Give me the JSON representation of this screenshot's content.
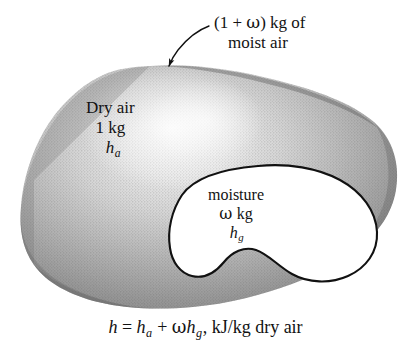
{
  "figure": {
    "background_color": "#ffffff",
    "ink_color": "#121212",
    "outer_blob": {
      "name": "dry-air-mass",
      "fill_style": "halftone-gray-gradient",
      "gray_edge": "#8a8a8a",
      "gray_center": "#e8e8e8",
      "has_outline": false
    },
    "inner_blob": {
      "name": "moisture-mass",
      "fill": "#ffffff",
      "stroke": "#111111",
      "stroke_width": 2
    },
    "arrow": {
      "name": "callout-arrow",
      "stroke": "#111111",
      "stroke_width": 1.3,
      "from": [
        207,
        27
      ],
      "to": [
        167,
        68
      ]
    }
  },
  "callout": {
    "line1_open": "(1 + ",
    "line1_omega": "ω",
    "line1_close": ") kg of",
    "line2": "moist air"
  },
  "dry_air": {
    "line1": "Dry air",
    "line2": "1 kg",
    "symbol": "h",
    "subscript": "a"
  },
  "moisture": {
    "line1": "moisture",
    "omega": "ω",
    "unit": "kg",
    "symbol": "h",
    "subscript": "g"
  },
  "equation": {
    "lhs": "h",
    "equals": " = ",
    "term1_sym": "h",
    "term1_sub": "a",
    "plus": " + ",
    "omega": "ω",
    "term2_sym": "h",
    "term2_sub": "g",
    "tail": ", kJ/kg dry air"
  }
}
